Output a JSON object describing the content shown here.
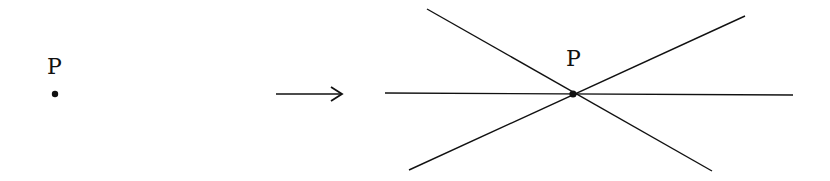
{
  "diagram": {
    "left_point": {
      "label": "P",
      "x": 55,
      "y": 94
    },
    "arrow": {
      "from": [
        276,
        94
      ],
      "to": [
        342,
        94
      ],
      "meaning": "maps-to"
    },
    "right_point": {
      "label": "P",
      "x": 573,
      "y": 94
    },
    "lines_through_point": [
      {
        "name": "horizontal-line",
        "x1": 385,
        "y1": 93,
        "x2": 793,
        "y2": 95
      },
      {
        "name": "descending-line",
        "x1": 427,
        "y1": 9,
        "x2": 712,
        "y2": 171
      },
      {
        "name": "ascending-line",
        "x1": 409,
        "y1": 170,
        "x2": 745,
        "y2": 16
      }
    ],
    "stroke_color": "#111111"
  }
}
